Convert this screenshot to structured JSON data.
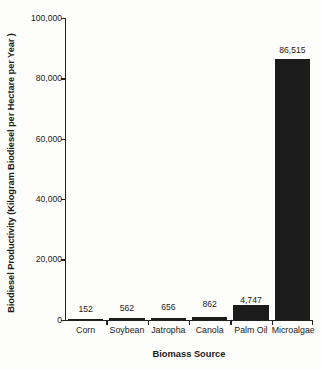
{
  "chart_data": {
    "type": "bar",
    "title": "",
    "xlabel": "Biomass Source",
    "ylabel": "Biodiesel Productivity (Kilogram Biodiesel per Hectare per Year )",
    "categories": [
      "Corn",
      "Soybean",
      "Jatropha",
      "Canola",
      "Palm Oil",
      "Microalgae"
    ],
    "values": [
      152,
      562,
      656,
      862,
      4747,
      86515
    ],
    "value_labels": [
      "152",
      "562",
      "656",
      "862",
      "4,747",
      "86,515"
    ],
    "ylim": [
      0,
      100000
    ],
    "yticks": [
      0,
      20000,
      40000,
      60000,
      80000,
      100000
    ],
    "ytick_labels": [
      "0",
      "20,000",
      "40,000",
      "60,000",
      "80,000",
      "100,000"
    ],
    "grid": false,
    "legend": false,
    "bar_color": "#1c1c1c",
    "background_color": "#fdfdfc",
    "axis_color": "#222222"
  }
}
